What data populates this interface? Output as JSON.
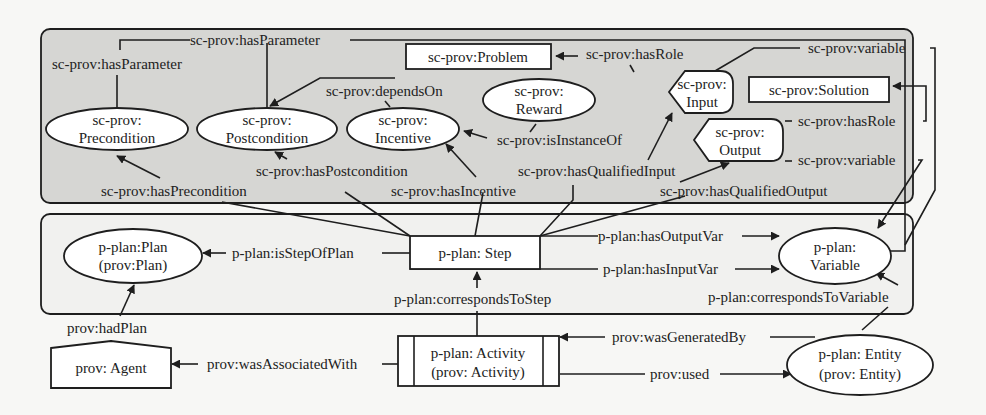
{
  "groups": {
    "sc_prov": {
      "fill": "#d6d6d3"
    },
    "p_plan": {
      "fill": "#f1f1ef"
    }
  },
  "nodes": {
    "precondition": [
      "sc-prov:",
      "Precondition"
    ],
    "postcondition": [
      "sc-prov:",
      "Postcondition"
    ],
    "incentive": [
      "sc-prov:",
      "Incentive"
    ],
    "reward": [
      "sc-prov:",
      "Reward"
    ],
    "problem": "sc-prov:Problem",
    "input": [
      "sc-prov:",
      "Input"
    ],
    "solution": "sc-prov:Solution",
    "output": [
      "sc-prov:",
      "Output"
    ],
    "plan": [
      "p-plan:Plan",
      "(prov:Plan)"
    ],
    "step": "p-plan: Step",
    "variable": [
      "p-plan:",
      "Variable"
    ],
    "agent": "prov: Agent",
    "activity": [
      "p-plan: Activity",
      "(prov: Activity)"
    ],
    "entity": [
      "p-plan: Entity",
      "(prov: Entity)"
    ]
  },
  "edges": {
    "has_parameter_1": "sc-prov:hasParameter",
    "has_parameter_2": "sc-prov:hasParameter",
    "depends_on": "sc-prov:dependsOn",
    "has_role_problem": "sc-prov:hasRole",
    "variable_input": "sc-prov:variable",
    "is_instance_of": "sc-prov:isInstanceOf",
    "has_role_solution": "sc-prov:hasRole",
    "variable_output": "sc-prov:variable",
    "has_postcondition": "sc-prov:hasPostcondition",
    "has_qualified_input": "sc-prov:hasQualifiedInput",
    "has_precondition": "sc-prov:hasPrecondition",
    "has_incentive": "sc-prov:hasIncentive",
    "has_qualified_output": "sc-prov:hasQualifiedOutput",
    "is_step_of_plan": "p-plan:isStepOfPlan",
    "has_output_var": "p-plan:hasOutputVar",
    "has_input_var": "p-plan:hasInputVar",
    "corresponds_to_step": "p-plan:correspondsToStep",
    "corresponds_to_variable": "p-plan:correspondsToVariable",
    "had_plan": "prov:hadPlan",
    "was_associated_with": "prov:wasAssociatedWith",
    "was_generated_by": "prov:wasGeneratedBy",
    "used": "prov:used"
  }
}
